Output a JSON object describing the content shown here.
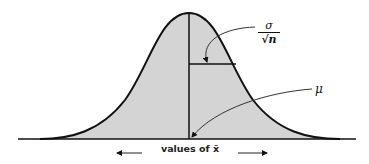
{
  "diagram": {
    "type": "normal-distribution-sampling",
    "labels": {
      "std_error_numerator": "σ",
      "std_error_denominator": "√n",
      "mean": "μ",
      "axis": "values of x̄"
    },
    "colors": {
      "fill": "#d4d4d4",
      "stroke": "#111111",
      "background": "#ffffff"
    }
  }
}
